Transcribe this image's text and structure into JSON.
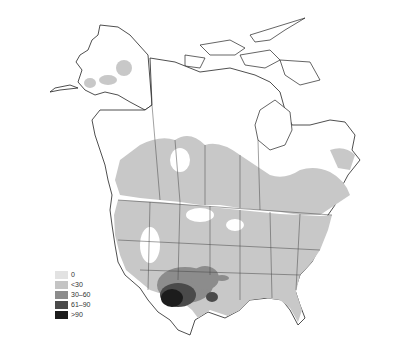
{
  "map": {
    "region": "North America",
    "style": "grayscale choropleth with state/province boundaries",
    "base_fill": "#ffffff",
    "outline_color": "#222222",
    "range_fill": "#c8c8c8"
  },
  "legend": {
    "items": [
      {
        "label": "0",
        "color": "#e2e2e2"
      },
      {
        "label": "<30",
        "color": "#c4c4c4"
      },
      {
        "label": "30–60",
        "color": "#8c8c8c"
      },
      {
        "label": "61–90",
        "color": "#4a4a4a"
      },
      {
        "label": ">90",
        "color": "#1c1c1c"
      }
    ]
  },
  "hotspots": {
    "southwest_core": "Arizona / Sonora, Mexico (>90)",
    "secondary": "New Mexico / Chihuahua (30–60, 61–90)"
  }
}
